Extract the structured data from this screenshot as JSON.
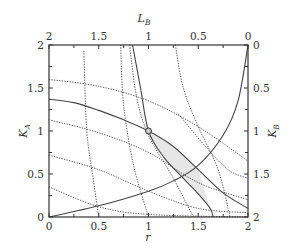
{
  "chart_data": {
    "type": "line",
    "title": "",
    "xlabel": "r",
    "ylabel": "K_A",
    "top_xlabel": "L_B",
    "right_ylabel": "K_B",
    "xlim": [
      0,
      2
    ],
    "ylim": [
      0,
      2
    ],
    "top_xlim": [
      2,
      0
    ],
    "right_ylim": [
      2,
      0
    ],
    "grid": false,
    "x_ticks": [
      "0",
      "0.5",
      "1",
      "1.5",
      "2"
    ],
    "y_ticks": [
      "0",
      "0.5",
      "1",
      "1.5",
      "2"
    ],
    "top_ticks": [
      "2",
      "1.5",
      "1",
      "0.5",
      "0"
    ],
    "right_ticks": [
      "0",
      "0.5",
      "1",
      "1.5",
      "2"
    ],
    "marker": {
      "x": 1.0,
      "y": 1.0,
      "style": "open-circle"
    },
    "series": [
      {
        "name": "solid-decreasing",
        "style": "solid",
        "points": [
          [
            0,
            1.37
          ],
          [
            0.25,
            1.33
          ],
          [
            0.5,
            1.24
          ],
          [
            0.75,
            1.13
          ],
          [
            1.0,
            1.0
          ],
          [
            1.25,
            0.82
          ],
          [
            1.5,
            0.55
          ],
          [
            1.75,
            0.28
          ],
          [
            2.0,
            0.1
          ]
        ]
      },
      {
        "name": "solid-increasing",
        "style": "solid",
        "points": [
          [
            0,
            0
          ],
          [
            0.5,
            0.13
          ],
          [
            1.0,
            0.3
          ],
          [
            1.25,
            0.42
          ],
          [
            1.5,
            0.6
          ],
          [
            1.75,
            0.95
          ],
          [
            1.9,
            1.35
          ],
          [
            2.0,
            2.0
          ]
        ]
      },
      {
        "name": "solid-steep",
        "style": "solid",
        "points": [
          [
            0.84,
            2.0
          ],
          [
            0.92,
            1.5
          ],
          [
            1.0,
            1.0
          ],
          [
            1.15,
            0.7
          ],
          [
            1.35,
            0.45
          ],
          [
            1.5,
            0.27
          ],
          [
            1.62,
            0.1
          ],
          [
            1.65,
            0.0
          ]
        ]
      },
      {
        "name": "dotted-1",
        "style": "dotted",
        "points": [
          [
            0,
            1.6
          ],
          [
            0.5,
            1.52
          ],
          [
            1.0,
            1.35
          ],
          [
            1.5,
            1.05
          ],
          [
            2.0,
            0.65
          ]
        ]
      },
      {
        "name": "dotted-2",
        "style": "dotted",
        "points": [
          [
            0,
            1.13
          ],
          [
            0.5,
            0.98
          ],
          [
            1.0,
            0.75
          ],
          [
            1.5,
            0.4
          ],
          [
            2.0,
            0.2
          ]
        ]
      },
      {
        "name": "dotted-3",
        "style": "dotted",
        "points": [
          [
            0,
            0.72
          ],
          [
            0.5,
            0.55
          ],
          [
            1.0,
            0.3
          ],
          [
            1.5,
            0.1
          ],
          [
            2.0,
            0.05
          ]
        ]
      },
      {
        "name": "dotted-4",
        "style": "dotted",
        "points": [
          [
            0,
            0.35
          ],
          [
            0.5,
            0.12
          ],
          [
            1.0,
            0.03
          ],
          [
            2.0,
            0.0
          ]
        ]
      },
      {
        "name": "dotted-5",
        "style": "dotted",
        "points": [
          [
            0.35,
            1.93
          ],
          [
            0.38,
            1.0
          ],
          [
            0.45,
            0.4
          ],
          [
            0.5,
            0.0
          ]
        ]
      },
      {
        "name": "dotted-6",
        "style": "dotted",
        "points": [
          [
            0.72,
            2.0
          ],
          [
            0.75,
            1.3
          ],
          [
            0.85,
            0.6
          ],
          [
            1.0,
            0.0
          ]
        ]
      },
      {
        "name": "dotted-7",
        "style": "dotted",
        "points": [
          [
            0.81,
            2.0
          ],
          [
            0.88,
            1.4
          ],
          [
            1.0,
            0.95
          ],
          [
            1.25,
            0.45
          ],
          [
            1.45,
            0.0
          ]
        ]
      },
      {
        "name": "dotted-8",
        "style": "dotted",
        "points": [
          [
            1.27,
            2.0
          ],
          [
            1.35,
            1.5
          ],
          [
            1.5,
            1.05
          ],
          [
            1.7,
            0.55
          ],
          [
            1.82,
            0.0
          ]
        ]
      },
      {
        "name": "dotted-9",
        "style": "dotted",
        "points": [
          [
            1.3,
            1.2
          ],
          [
            1.55,
            0.85
          ],
          [
            1.8,
            0.55
          ],
          [
            2.0,
            0.45
          ]
        ]
      }
    ],
    "shaded_region": {
      "description": "lens between solid-decreasing and solid-steep from (1,1) to (1.62,0.1)",
      "color": "#e6e6e6"
    }
  },
  "labels": {
    "x_title": "r",
    "y_title_main": "K",
    "y_title_sub": "A",
    "top_title_main": "L",
    "top_title_sub": "B",
    "right_title_main": "K",
    "right_title_sub": "B"
  },
  "colors": {
    "line": "#444444",
    "axis": "#333333",
    "shade": "#e6e6e6"
  }
}
